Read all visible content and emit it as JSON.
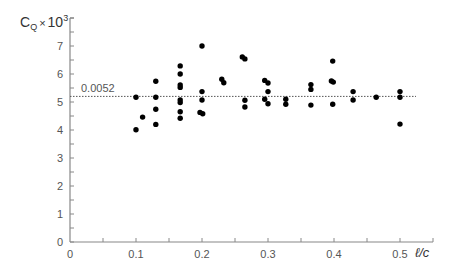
{
  "chart_data": {
    "type": "scatter",
    "title": "",
    "xlabel": "ℓ/c",
    "ylabel": "C_Q × 10^3",
    "ylabel_parts": {
      "base": "C",
      "sub": "Q",
      "times": "×",
      "ten": "10",
      "sup": "3"
    },
    "xlim": [
      0,
      0.55
    ],
    "ylim": [
      0,
      8
    ],
    "x_ticks": [
      0,
      0.1,
      0.2,
      0.3,
      0.4,
      0.5
    ],
    "x_tick_labels": [
      "0",
      "0.1",
      "0.2",
      "0.3",
      "0.4",
      "0.5"
    ],
    "x_minor_step": 0.05,
    "y_ticks": [
      0,
      1,
      2,
      3,
      4,
      5,
      6,
      7
    ],
    "y_tick_labels": [
      "0",
      "1",
      "2",
      "3",
      "4",
      "5",
      "6",
      "7"
    ],
    "y_minor_step": 0.5,
    "grid": false,
    "legend": null,
    "reference_line": {
      "y": 5.2,
      "label": "0.0052",
      "style": "dotted"
    },
    "series": [
      {
        "name": "measurements",
        "marker": "filled-circle",
        "color": "#000000",
        "points": [
          [
            0.1,
            5.17
          ],
          [
            0.1,
            4.01
          ],
          [
            0.11,
            4.46
          ],
          [
            0.13,
            5.74
          ],
          [
            0.13,
            5.17
          ],
          [
            0.13,
            4.74
          ],
          [
            0.13,
            4.2
          ],
          [
            0.167,
            6.29
          ],
          [
            0.167,
            6.0
          ],
          [
            0.167,
            5.61
          ],
          [
            0.167,
            5.52
          ],
          [
            0.167,
            5.07
          ],
          [
            0.167,
            4.98
          ],
          [
            0.167,
            4.65
          ],
          [
            0.167,
            4.42
          ],
          [
            0.2,
            7.0
          ],
          [
            0.2,
            5.37
          ],
          [
            0.2,
            5.07
          ],
          [
            0.197,
            4.63
          ],
          [
            0.201,
            4.58
          ],
          [
            0.23,
            5.81
          ],
          [
            0.233,
            5.69
          ],
          [
            0.261,
            6.61
          ],
          [
            0.265,
            6.54
          ],
          [
            0.265,
            5.06
          ],
          [
            0.265,
            4.82
          ],
          [
            0.295,
            5.77
          ],
          [
            0.3,
            5.68
          ],
          [
            0.3,
            5.37
          ],
          [
            0.295,
            5.1
          ],
          [
            0.3,
            4.94
          ],
          [
            0.327,
            5.1
          ],
          [
            0.327,
            4.92
          ],
          [
            0.365,
            5.62
          ],
          [
            0.365,
            5.45
          ],
          [
            0.365,
            4.89
          ],
          [
            0.398,
            6.46
          ],
          [
            0.396,
            5.75
          ],
          [
            0.399,
            5.71
          ],
          [
            0.398,
            4.92
          ],
          [
            0.429,
            5.37
          ],
          [
            0.429,
            5.07
          ],
          [
            0.464,
            5.17
          ],
          [
            0.5,
            5.37
          ],
          [
            0.5,
            5.17
          ],
          [
            0.5,
            4.21
          ]
        ]
      }
    ]
  },
  "colors": {
    "axis": "#888888",
    "tick_label": "#555555",
    "point": "#000000",
    "reference_line": "#555555"
  }
}
